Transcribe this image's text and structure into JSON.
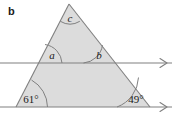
{
  "figure": {
    "part_label": "b",
    "background_color": "#ffffff",
    "shape_fill_color": "#dcdcdc",
    "stroke_color": "#808080",
    "text_color": "#1a1a1a"
  },
  "angles": {
    "apex": {
      "name": "angle-c",
      "label": "c",
      "type": "variable"
    },
    "interior_left": {
      "name": "angle-a",
      "label": "a",
      "type": "variable"
    },
    "interior_right": {
      "name": "angle-b",
      "label": "b",
      "type": "variable"
    },
    "base_left": {
      "name": "angle-61",
      "label": "61°",
      "type": "value",
      "degrees": 61
    },
    "base_right": {
      "name": "angle-49",
      "label": "49°",
      "type": "value",
      "degrees": 49
    }
  },
  "lines": {
    "upper_parallel": {
      "name": "upper-parallel-line",
      "arrow_marks": 1
    },
    "lower_parallel": {
      "name": "lower-parallel-line",
      "arrow_marks": 1
    }
  }
}
